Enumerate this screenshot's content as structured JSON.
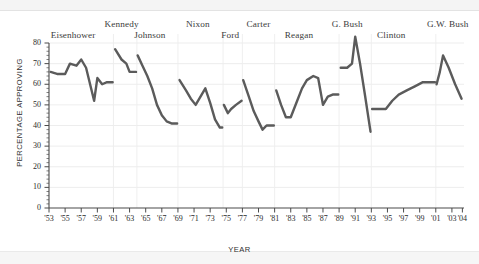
{
  "chart_data": {
    "type": "line",
    "title": "",
    "xlabel": "YEAR",
    "ylabel": "PERCENTAGE APPROVING",
    "ylim": [
      0,
      80
    ],
    "yticks": [
      0,
      10,
      20,
      30,
      40,
      50,
      60,
      70,
      80
    ],
    "xlim": [
      1953,
      2004.5
    ],
    "xticks": [
      "'53",
      "'55",
      "'57",
      "'59",
      "'61",
      "'63",
      "'65",
      "'67",
      "'69",
      "'71",
      "'73",
      "'75",
      "'77",
      "'79",
      "'81",
      "'83",
      "'85",
      "'87",
      "'89",
      "'91",
      "'93",
      "'95",
      "'97",
      "'99",
      "'01",
      "'03",
      "'04"
    ],
    "grid": true,
    "legend": "none",
    "line_color": "#5b5b5b",
    "gridline_color": "#e8e8e8",
    "axis_color": "#4a4a4a",
    "annotations": [
      {
        "label": "Eisenhower",
        "x": 1956.0,
        "y_px": 30
      },
      {
        "label": "Kennedy",
        "x": 1962.0,
        "y_px": 19
      },
      {
        "label": "Johnson",
        "x": 1965.5,
        "y_px": 30
      },
      {
        "label": "Nixon",
        "x": 1971.5,
        "y_px": 19
      },
      {
        "label": "Ford",
        "x": 1975.5,
        "y_px": 30
      },
      {
        "label": "Carter",
        "x": 1979.0,
        "y_px": 19
      },
      {
        "label": "Reagan",
        "x": 1984.0,
        "y_px": 30
      },
      {
        "label": "G. Bush",
        "x": 1990.0,
        "y_px": 19
      },
      {
        "label": "Clinton",
        "x": 1995.5,
        "y_px": 30
      },
      {
        "label": "G.W. Bush",
        "x": 2002.5,
        "y_px": 19
      }
    ],
    "term_boundaries": [
      1961,
      1963.9,
      1969,
      1974.6,
      1977,
      1981,
      1989,
      1993,
      2001
    ],
    "series": [
      {
        "name": "Presidential approval",
        "segments": [
          {
            "president": "Eisenhower",
            "points": [
              {
                "x": 1953.2,
                "y": 66
              },
              {
                "x": 1954.0,
                "y": 65
              },
              {
                "x": 1955.0,
                "y": 65
              },
              {
                "x": 1955.6,
                "y": 70
              },
              {
                "x": 1956.4,
                "y": 69
              },
              {
                "x": 1957.0,
                "y": 72
              },
              {
                "x": 1957.6,
                "y": 68
              },
              {
                "x": 1958.6,
                "y": 52
              },
              {
                "x": 1959.0,
                "y": 63
              },
              {
                "x": 1959.6,
                "y": 60
              },
              {
                "x": 1960.2,
                "y": 61
              },
              {
                "x": 1960.9,
                "y": 61
              }
            ]
          },
          {
            "president": "Kennedy",
            "points": [
              {
                "x": 1961.2,
                "y": 77
              },
              {
                "x": 1962.0,
                "y": 72
              },
              {
                "x": 1962.6,
                "y": 70
              },
              {
                "x": 1963.0,
                "y": 66
              },
              {
                "x": 1963.8,
                "y": 66
              }
            ]
          },
          {
            "president": "Johnson",
            "points": [
              {
                "x": 1964.0,
                "y": 74
              },
              {
                "x": 1964.6,
                "y": 69
              },
              {
                "x": 1965.2,
                "y": 64
              },
              {
                "x": 1965.8,
                "y": 58
              },
              {
                "x": 1966.4,
                "y": 50
              },
              {
                "x": 1967.0,
                "y": 45
              },
              {
                "x": 1967.6,
                "y": 42
              },
              {
                "x": 1968.2,
                "y": 41
              },
              {
                "x": 1968.9,
                "y": 41
              }
            ]
          },
          {
            "president": "Nixon",
            "points": [
              {
                "x": 1969.2,
                "y": 62
              },
              {
                "x": 1970.0,
                "y": 57
              },
              {
                "x": 1970.6,
                "y": 53
              },
              {
                "x": 1971.2,
                "y": 50
              },
              {
                "x": 1971.8,
                "y": 54
              },
              {
                "x": 1972.4,
                "y": 58
              },
              {
                "x": 1973.0,
                "y": 51
              },
              {
                "x": 1973.6,
                "y": 43
              },
              {
                "x": 1974.2,
                "y": 39
              },
              {
                "x": 1974.5,
                "y": 39
              }
            ]
          },
          {
            "president": "Ford",
            "points": [
              {
                "x": 1974.7,
                "y": 50
              },
              {
                "x": 1975.2,
                "y": 46
              },
              {
                "x": 1975.6,
                "y": 48
              },
              {
                "x": 1976.2,
                "y": 50
              },
              {
                "x": 1976.9,
                "y": 52
              }
            ]
          },
          {
            "president": "Carter",
            "points": [
              {
                "x": 1977.1,
                "y": 62
              },
              {
                "x": 1977.8,
                "y": 54
              },
              {
                "x": 1978.4,
                "y": 47
              },
              {
                "x": 1979.0,
                "y": 42
              },
              {
                "x": 1979.5,
                "y": 38
              },
              {
                "x": 1980.0,
                "y": 40
              },
              {
                "x": 1980.9,
                "y": 40
              }
            ]
          },
          {
            "president": "Reagan",
            "points": [
              {
                "x": 1981.2,
                "y": 57
              },
              {
                "x": 1981.8,
                "y": 50
              },
              {
                "x": 1982.4,
                "y": 44
              },
              {
                "x": 1983.0,
                "y": 44
              },
              {
                "x": 1983.8,
                "y": 52
              },
              {
                "x": 1984.4,
                "y": 58
              },
              {
                "x": 1985.0,
                "y": 62
              },
              {
                "x": 1985.8,
                "y": 64
              },
              {
                "x": 1986.4,
                "y": 63
              },
              {
                "x": 1987.0,
                "y": 50
              },
              {
                "x": 1987.6,
                "y": 54
              },
              {
                "x": 1988.2,
                "y": 55
              },
              {
                "x": 1988.9,
                "y": 55
              }
            ]
          },
          {
            "president": "G. Bush",
            "points": [
              {
                "x": 1989.2,
                "y": 68
              },
              {
                "x": 1990.0,
                "y": 68
              },
              {
                "x": 1990.6,
                "y": 70
              },
              {
                "x": 1991.0,
                "y": 83
              },
              {
                "x": 1991.6,
                "y": 70
              },
              {
                "x": 1992.2,
                "y": 55
              },
              {
                "x": 1992.9,
                "y": 37
              }
            ]
          },
          {
            "president": "Clinton",
            "points": [
              {
                "x": 1993.1,
                "y": 48
              },
              {
                "x": 1994.0,
                "y": 48
              },
              {
                "x": 1994.8,
                "y": 48
              },
              {
                "x": 1995.6,
                "y": 52
              },
              {
                "x": 1996.4,
                "y": 55
              },
              {
                "x": 1997.4,
                "y": 57
              },
              {
                "x": 1998.4,
                "y": 59
              },
              {
                "x": 1999.4,
                "y": 61
              },
              {
                "x": 2000.9,
                "y": 61
              }
            ]
          },
          {
            "president": "G.W. Bush",
            "points": [
              {
                "x": 2001.1,
                "y": 60
              },
              {
                "x": 2001.5,
                "y": 66
              },
              {
                "x": 2001.9,
                "y": 74
              },
              {
                "x": 2002.6,
                "y": 68
              },
              {
                "x": 2003.4,
                "y": 60
              },
              {
                "x": 2004.2,
                "y": 53
              }
            ]
          }
        ]
      }
    ]
  }
}
